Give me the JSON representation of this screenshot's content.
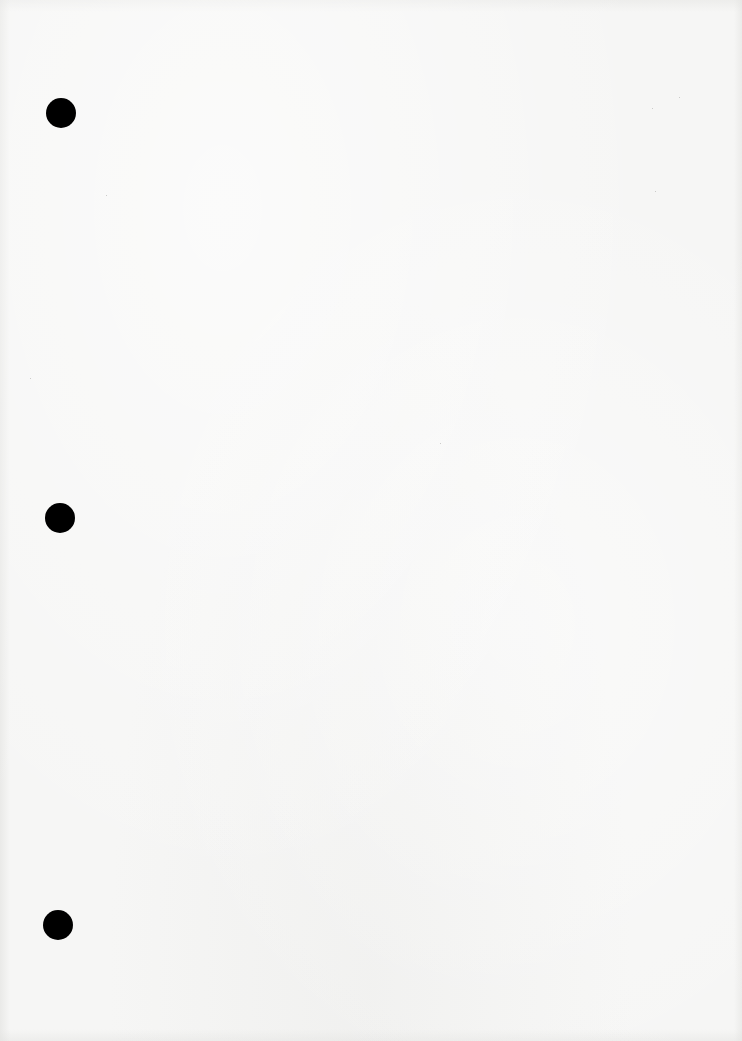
{
  "document": {
    "type": "blank-page",
    "paper_color": "#f6f6f5",
    "punch_hole_color": "#000000",
    "punch_holes": [
      {
        "x": 61,
        "y": 113,
        "diameter": 30
      },
      {
        "x": 60,
        "y": 518,
        "diameter": 30
      },
      {
        "x": 58,
        "y": 925,
        "diameter": 30
      }
    ]
  }
}
